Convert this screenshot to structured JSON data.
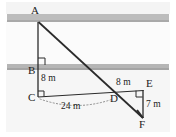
{
  "figure": {
    "background_color": "#ffffff",
    "stroke_color": "#2b2b2b",
    "band_color": "#b9b9b9",
    "haze_color": "#f2f2f2"
  },
  "vertices": [
    {
      "id": "A",
      "label": "A",
      "x": 38,
      "y": 22
    },
    {
      "id": "B",
      "label": "B",
      "x": 38,
      "y": 70
    },
    {
      "id": "C",
      "label": "C",
      "x": 38,
      "y": 97
    },
    {
      "id": "D",
      "label": "D",
      "x": 114,
      "y": 97
    },
    {
      "id": "E",
      "label": "E",
      "x": 143,
      "y": 90
    },
    {
      "id": "F",
      "label": "F",
      "x": 143,
      "y": 118
    }
  ],
  "dimensions": [
    {
      "id": "bc",
      "label": "8 m",
      "segment": "B-C",
      "value": 8,
      "unit": "m"
    },
    {
      "id": "cd",
      "label": "24 m",
      "segment": "C-D",
      "value": 24,
      "unit": "m"
    },
    {
      "id": "de",
      "label": "8 m",
      "segment": "D-E",
      "value": 8,
      "unit": "m"
    },
    {
      "id": "ef",
      "label": "7 m",
      "segment": "E-F",
      "value": 7,
      "unit": "m"
    }
  ],
  "labels": {
    "A": "A",
    "B": "B",
    "C": "C",
    "D": "D",
    "E": "E",
    "F": "F",
    "bc_length": "8 m",
    "cd_length": "24 m",
    "de_length": "8 m",
    "ef_length": "7 m"
  },
  "right_angles": [
    {
      "at": "B",
      "between": "A-B and B-C"
    },
    {
      "at": "C",
      "between": "C-B and C-D"
    },
    {
      "at": "E",
      "between": "D-E and E-F"
    }
  ],
  "bands": [
    {
      "id": "upper-band",
      "y": 14,
      "height": 7
    },
    {
      "id": "lower-band",
      "y": 64,
      "height": 6
    }
  ]
}
